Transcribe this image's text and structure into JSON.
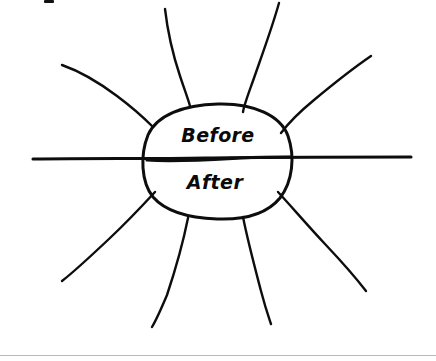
{
  "page": {
    "background_color": "#ffffff",
    "width": 436,
    "height": 361
  },
  "diagram": {
    "type": "hand-drawn-starburst",
    "stroke_color": "#0d0d0d",
    "fill_color": "#ffffff",
    "center_shape": {
      "name": "central-ellipse",
      "cx": 218,
      "cy": 161,
      "rx": 74,
      "ry": 57
    },
    "labels": {
      "top_half": "Before",
      "bottom_half": "After",
      "top_half_x": 218,
      "top_half_y": 136,
      "bottom_half_x": 215,
      "bottom_half_y": 182
    },
    "divider": {
      "name": "horizontal-axis-line",
      "x_start": 33,
      "x_end": 411,
      "y_left": 159,
      "y_right": 157
    },
    "rays": [
      {
        "name": "ray-top-left",
        "label": "upper left vertical ray"
      },
      {
        "name": "ray-top-right",
        "label": "upper right vertical ray"
      },
      {
        "name": "ray-upper-left-diag",
        "label": "upper left diagonal ray"
      },
      {
        "name": "ray-upper-right-diag",
        "label": "upper right diagonal ray"
      },
      {
        "name": "ray-lower-left-diag",
        "label": "lower left diagonal ray"
      },
      {
        "name": "ray-lower-right-diag",
        "label": "lower right diagonal ray"
      },
      {
        "name": "ray-bottom-left",
        "label": "lower left vertical ray"
      },
      {
        "name": "ray-bottom-right",
        "label": "lower right vertical ray"
      }
    ]
  },
  "artifacts": {
    "top_clipped_mark": "clipped ink mark at top edge",
    "bottom_rule_color": "#b9b9b9"
  }
}
